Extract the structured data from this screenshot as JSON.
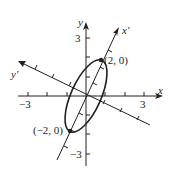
{
  "diagram": {
    "type": "rotated-ellipse-coordinate-system",
    "colors": {
      "ink": "#231f20",
      "background": "#ffffff"
    },
    "axes": {
      "x": {
        "label": "x",
        "tick_labels": {
          "neg": "−3",
          "pos": "3"
        }
      },
      "y": {
        "label": "y",
        "tick_labels": {
          "pos": "3",
          "neg": "−3"
        }
      },
      "x_prime": {
        "label": "x′"
      },
      "y_prime": {
        "label": "y′"
      }
    },
    "points": [
      {
        "label": "(2, 0)"
      },
      {
        "label": "(−2, 0)"
      }
    ]
  }
}
